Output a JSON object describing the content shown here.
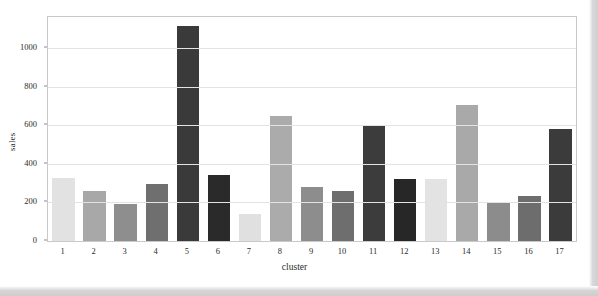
{
  "figure": {
    "background_color": "#ffffff",
    "panel_border_color": "#c9c9c9",
    "grid_color": "#e3e3e3"
  },
  "chart_data": {
    "type": "bar",
    "title": "",
    "xlabel": "cluster",
    "ylabel": "sales",
    "categories": [
      "1",
      "2",
      "3",
      "4",
      "5",
      "6",
      "7",
      "8",
      "9",
      "10",
      "11",
      "12",
      "13",
      "14",
      "15",
      "16",
      "17"
    ],
    "values": [
      325,
      258,
      193,
      295,
      1115,
      342,
      140,
      645,
      278,
      258,
      600,
      323,
      320,
      705,
      198,
      235,
      580
    ],
    "bar_colors": [
      "#e2e2e2",
      "#a8a8a8",
      "#8e8e8e",
      "#6f6f6f",
      "#3a3a3a",
      "#2a2a2a",
      "#e0e0e0",
      "#ababab",
      "#8d8d8d",
      "#6e6e6e",
      "#3c3c3c",
      "#272727",
      "#e3e3e3",
      "#a9a9a9",
      "#8c8c8c",
      "#6d6d6d",
      "#3b3b3b"
    ],
    "ylim": [
      0,
      1160
    ],
    "yticks": [
      0,
      200,
      400,
      600,
      800,
      1000
    ],
    "ytick_labels": [
      "0",
      "200",
      "400",
      "600",
      "800",
      "1000"
    ],
    "grid": true,
    "grid_axis": "y",
    "legend": null
  }
}
